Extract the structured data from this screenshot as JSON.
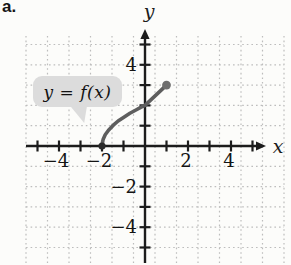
{
  "figure_label": "a.",
  "callout": {
    "text": "y = f(x)"
  },
  "chart_data": {
    "type": "line",
    "title": "",
    "xlabel": "x",
    "ylabel": "y",
    "xlim": [
      -5.5,
      6.5
    ],
    "ylim": [
      -5.8,
      5.7
    ],
    "grid": "dotted",
    "legend": "none",
    "x_ticks": [
      -5,
      -4,
      -3,
      -2,
      -1,
      1,
      2,
      3,
      4,
      5
    ],
    "y_ticks": [
      -5,
      -4,
      -3,
      -2,
      -1,
      1,
      2,
      3,
      4,
      5
    ],
    "x_tick_labels": [
      {
        "value": -4,
        "label": "−4"
      },
      {
        "value": -2,
        "label": "−2"
      },
      {
        "value": 2,
        "label": "2"
      },
      {
        "value": 4,
        "label": "4"
      }
    ],
    "y_tick_labels": [
      {
        "value": 4,
        "label": "4"
      },
      {
        "value": -2,
        "label": "−2"
      },
      {
        "value": -4,
        "label": "−4"
      }
    ],
    "series": [
      {
        "name": "y = f(x)",
        "points": [
          [
            -2,
            0
          ],
          [
            -1.95,
            0.32
          ],
          [
            -1.85,
            0.55
          ],
          [
            -1.7,
            0.78
          ],
          [
            -1.5,
            1.0
          ],
          [
            -1.25,
            1.23
          ],
          [
            -1.0,
            1.41
          ],
          [
            -0.7,
            1.61
          ],
          [
            -0.4,
            1.79
          ],
          [
            -0.2,
            1.9
          ],
          [
            0,
            2
          ],
          [
            1,
            3
          ]
        ],
        "domain": [
          -2,
          1
        ],
        "start_point": {
          "x": -2,
          "y": 0,
          "style": "closed-dot",
          "color": "#2b2b2b"
        },
        "end_point": {
          "x": 1,
          "y": 3,
          "style": "closed-dot",
          "color": "#6e6e6e"
        }
      }
    ],
    "colors": {
      "axis": "#1c1c1c",
      "grid": "#bdbdbd",
      "curve": "#5e5e5e",
      "tick_label": "#141414",
      "callout_bg": "#dcdcdc"
    }
  }
}
